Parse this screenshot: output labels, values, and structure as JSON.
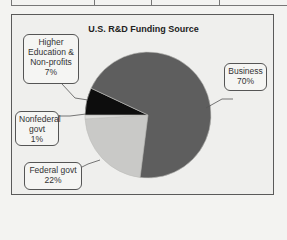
{
  "chart_data": {
    "type": "pie",
    "title": "U.S. R&D Funding Source",
    "slices": [
      {
        "label": "Business",
        "value": 70,
        "color": "#5e5e5e"
      },
      {
        "label": "Federal govt",
        "value": 22,
        "color": "#c9c9c7"
      },
      {
        "label": "Nonfederal govt",
        "value": 1,
        "color": "#dcdcda"
      },
      {
        "label": "Higher Education & Non-profits",
        "value": 7,
        "color": "#0d0d0d"
      }
    ],
    "legend": "callouts"
  },
  "labels": {
    "title": "U.S. R&D Funding Source",
    "business": {
      "name": "Business",
      "pct": "70%"
    },
    "higher_ed": {
      "line1": "Higher",
      "line2": "Education &",
      "line3": "Non-profits",
      "pct": "7%"
    },
    "nonfederal": {
      "line1": "Nonfederal",
      "line2": "govt",
      "pct": "1%"
    },
    "federal": {
      "name": "Federal govt",
      "pct": "22%"
    }
  }
}
